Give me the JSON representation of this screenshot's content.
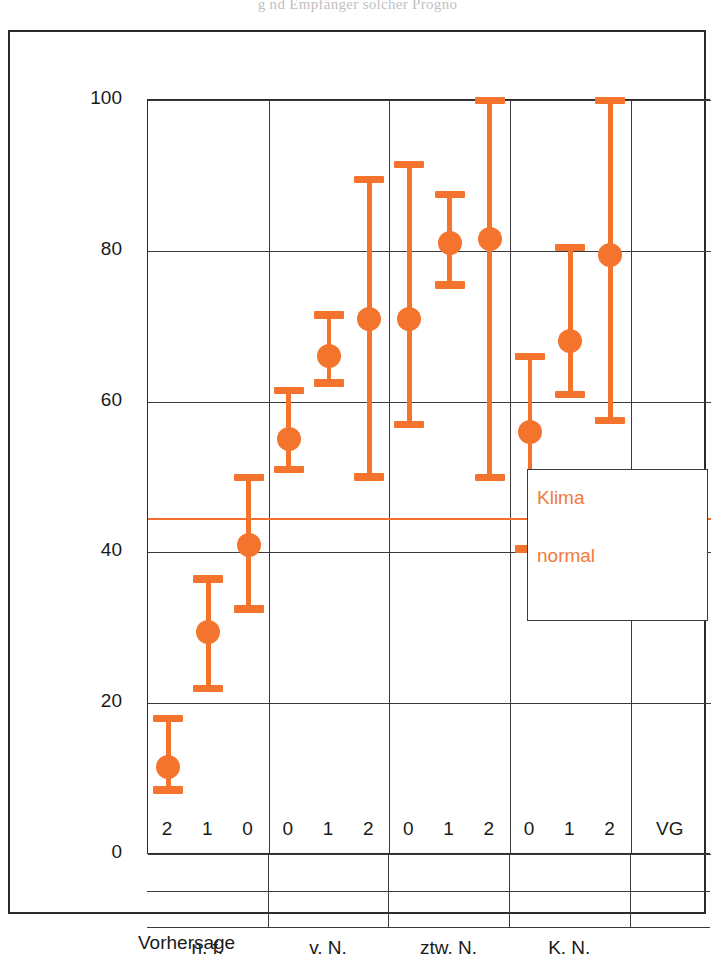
{
  "running_head": "g    nd Empfänger solcher Progno",
  "axes": {
    "ylabel": "Niederschlagswahrscheinlichkeit (%)",
    "yticks": [
      0,
      20,
      40,
      60,
      80,
      100
    ],
    "ylim": [
      0,
      100
    ],
    "xlabel": "Vorhersage",
    "groups": [
      {
        "label": "n. f.",
        "sublabels": [
          "2",
          "1",
          "0"
        ]
      },
      {
        "label": "v. N.",
        "sublabels": [
          "0",
          "1",
          "2"
        ]
      },
      {
        "label": "ztw. N.",
        "sublabels": [
          "0",
          "1",
          "2"
        ]
      },
      {
        "label": "K. N.",
        "sublabels": [
          "0",
          "1",
          "2"
        ]
      },
      {
        "label": "",
        "sublabels": [
          "VG"
        ]
      }
    ]
  },
  "legend": {
    "line1": "Klima",
    "line2": "normal",
    "reference_value": 44.6
  },
  "colors": {
    "marker": "#f4742d",
    "reference_line": "#f2712c",
    "legend_text": "#f07a3a",
    "axis": "#2b2b2b",
    "grid": "#3a3a3a"
  },
  "chart_data": {
    "type": "scatter",
    "title": "",
    "xlabel": "Vorhersage",
    "ylabel": "Niederschlagswahrscheinlichkeit (%)",
    "ylim": [
      0,
      100
    ],
    "yticks": [
      0,
      20,
      40,
      60,
      80,
      100
    ],
    "grid": true,
    "legend_position": "inset-right",
    "reference_line": {
      "label": "Klima normal",
      "value": 44.6
    },
    "categories": [
      "n. f. 2",
      "n. f. 1",
      "n. f. 0",
      "v. N. 0",
      "v. N. 1",
      "v. N. 2",
      "ztw. N. 0",
      "ztw. N. 1",
      "ztw. N. 2",
      "K. N. 0",
      "K. N. 1",
      "K. N. 2",
      "VG"
    ],
    "points": [
      {
        "category": "n. f. 2",
        "x_pct": 8.0,
        "value": 11.5,
        "low": 8.5,
        "high": 18.0
      },
      {
        "category": "n. f. 1",
        "x_pct": 16.0,
        "value": 29.5,
        "low": 22.0,
        "high": 36.5
      },
      {
        "category": "n. f. 0",
        "x_pct": 24.0,
        "value": 41.0,
        "low": 32.5,
        "high": 50.0
      },
      {
        "category": "v. N. 0",
        "x_pct": 33.0,
        "value": 55.0,
        "low": 51.0,
        "high": 61.5
      },
      {
        "category": "v. N. 1",
        "x_pct": 41.0,
        "value": 66.0,
        "low": 62.5,
        "high": 71.5
      },
      {
        "category": "v. N. 2",
        "x_pct": 49.0,
        "value": 71.0,
        "low": 50.0,
        "high": 89.5
      },
      {
        "category": "ztw. N. 0",
        "x_pct": 58.0,
        "value": 71.0,
        "low": 57.0,
        "high": 91.5
      },
      {
        "category": "ztw. N. 1",
        "x_pct": 66.0,
        "value": 81.0,
        "low": 75.5,
        "high": 87.5
      },
      {
        "category": "ztw. N. 2",
        "x_pct": 74.0,
        "value": 81.5,
        "low": 50.0,
        "high": 100.0
      },
      {
        "category": "K. N. 0",
        "x_pct": 83.0,
        "value": 56.0,
        "low": 40.5,
        "high": 66.0
      },
      {
        "category": "K. N. 1",
        "x_pct": 91.0,
        "value": 68.0,
        "low": 61.0,
        "high": 80.5
      },
      {
        "category": "K. N. 2",
        "x_pct": 98.5,
        "value": 79.5,
        "low": 57.5,
        "high": 100.0
      },
      {
        "category": "VG",
        "x_pct": 91.5,
        "value": 44.0,
        "low": 35.5,
        "high": 50.5
      }
    ]
  }
}
